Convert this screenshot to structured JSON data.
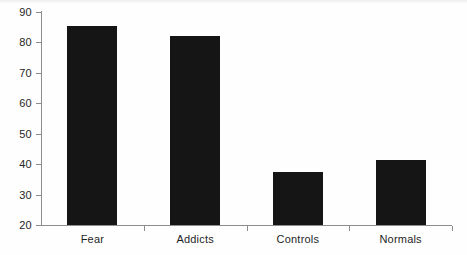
{
  "chart_data": {
    "type": "bar",
    "title": "",
    "subtitle": "",
    "xlabel": "",
    "ylabel": "",
    "categories": [
      "Fear",
      "Addicts",
      "Controls",
      "Normals"
    ],
    "values": [
      85.5,
      82.0,
      37.5,
      41.5
    ],
    "ylim": [
      20,
      90
    ],
    "yticks": [
      20,
      30,
      40,
      50,
      60,
      70,
      80,
      90
    ],
    "ytick_labels": [
      "20",
      "30",
      "40",
      "50",
      "60",
      "70",
      "80",
      "90"
    ],
    "grid": false,
    "legend": null,
    "bar_color": "#151515",
    "axis_color": "#8d8d8d",
    "background_color": "#fefefe"
  }
}
